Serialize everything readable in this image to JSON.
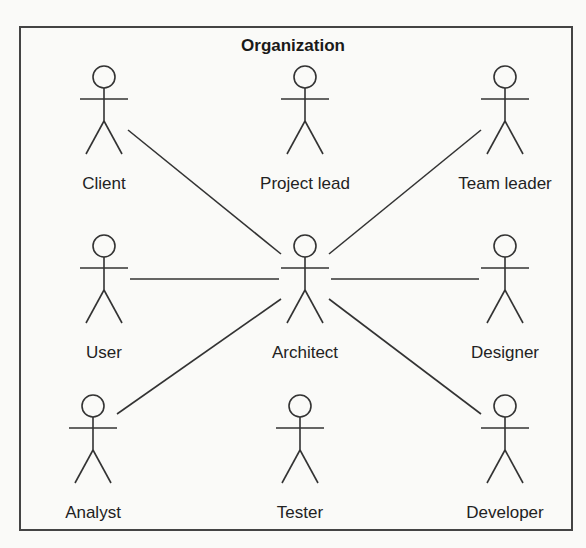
{
  "diagram": {
    "type": "UML use case diagram",
    "title": "Organization",
    "actors": [
      {
        "id": "client",
        "label": "Client",
        "x": 104,
        "y": 77
      },
      {
        "id": "project-lead",
        "label": "Project lead",
        "x": 305,
        "y": 77
      },
      {
        "id": "team-leader",
        "label": "Team leader",
        "x": 505,
        "y": 77
      },
      {
        "id": "user",
        "label": "User",
        "x": 104,
        "y": 246
      },
      {
        "id": "architect",
        "label": "Architect",
        "x": 305,
        "y": 246
      },
      {
        "id": "designer",
        "label": "Designer",
        "x": 505,
        "y": 246
      },
      {
        "id": "analyst",
        "label": "Analyst",
        "x": 93,
        "y": 406
      },
      {
        "id": "tester",
        "label": "Tester",
        "x": 300,
        "y": 406
      },
      {
        "id": "developer",
        "label": "Developer",
        "x": 505,
        "y": 406
      }
    ],
    "associations": [
      {
        "from": "client",
        "to": "architect"
      },
      {
        "from": "team-leader",
        "to": "architect"
      },
      {
        "from": "user",
        "to": "architect"
      },
      {
        "from": "designer",
        "to": "architect"
      },
      {
        "from": "analyst",
        "to": "architect"
      },
      {
        "from": "developer",
        "to": "architect"
      }
    ],
    "colors": {
      "stroke": "#333333",
      "background": "#fafaf8"
    }
  }
}
